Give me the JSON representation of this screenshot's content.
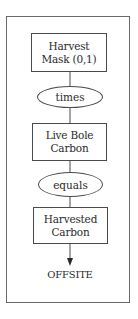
{
  "diagram": {
    "type": "flowchart",
    "nodes": [
      {
        "id": "harvest_mask",
        "shape": "rectangle",
        "lines": [
          "Harvest",
          "Mask (0,1)"
        ]
      },
      {
        "id": "times",
        "shape": "ellipse",
        "label": "times"
      },
      {
        "id": "live_bole_carbon",
        "shape": "rectangle",
        "lines": [
          "Live Bole",
          "Carbon"
        ]
      },
      {
        "id": "equals",
        "shape": "ellipse",
        "label": "equals"
      },
      {
        "id": "harvested_carbon",
        "shape": "rectangle",
        "lines": [
          "Harvested",
          "Carbon"
        ]
      },
      {
        "id": "offsite",
        "shape": "terminal-text",
        "label": "OFFSITE"
      }
    ],
    "edges": [
      {
        "from": "harvest_mask",
        "to": "times",
        "arrow": false
      },
      {
        "from": "times",
        "to": "live_bole_carbon",
        "arrow": false
      },
      {
        "from": "live_bole_carbon",
        "to": "equals",
        "arrow": false
      },
      {
        "from": "equals",
        "to": "harvested_carbon",
        "arrow": false
      },
      {
        "from": "harvested_carbon",
        "to": "offsite",
        "arrow": true
      }
    ],
    "colors": {
      "line": "#4a4a4a",
      "frame": "#6a6a6a",
      "text": "#2a2a2a",
      "background": "#ffffff"
    }
  }
}
